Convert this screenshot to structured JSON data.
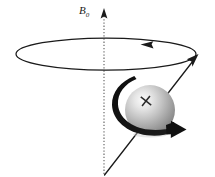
{
  "figure": {
    "background_color": "#ffffff",
    "width": 215,
    "height": 177
  },
  "labels": {
    "field_symbol": "B",
    "field_subscript": "0",
    "field_label_full": "B0"
  },
  "colors": {
    "stroke": "#1a1a1a",
    "axis_dotted": "#8c8c8c",
    "sphere_highlight": "#f2f2f2",
    "sphere_mid": "#b8b8b8",
    "sphere_shadow": "#6e6e6e",
    "spin_arrow": "#111111",
    "background": "#ffffff"
  },
  "elements": {
    "field_axis": {
      "name": "B0 field axis",
      "style": "dotted vertical line with arrowhead at top",
      "x": 104,
      "y_top": 13,
      "y_bottom": 175
    },
    "precession_cone": {
      "name": "precession circle",
      "style": "ellipse outline",
      "cx": 106,
      "cy": 54,
      "rx": 90,
      "ry": 16,
      "direction_arrow": "counterclockwise, arrowhead at top-right pointing left"
    },
    "spin_axis": {
      "name": "magnetic moment vector",
      "style": "solid line with arrowhead at upper right",
      "x_tail": 104,
      "y_tail": 175,
      "x_tip": 197,
      "y_tip": 56
    },
    "sphere": {
      "name": "charged spinning sphere",
      "cx": 150,
      "cy": 110,
      "r": 25,
      "marker": "+"
    },
    "spin_arrow": {
      "name": "rotation direction arrow",
      "style": "thick curved band wrapping the sphere, arrowhead at right"
    }
  }
}
